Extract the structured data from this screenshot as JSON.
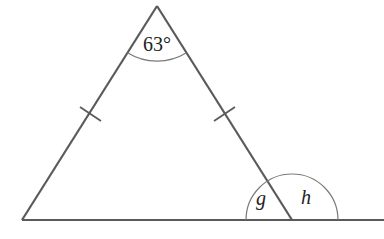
{
  "diagram": {
    "type": "isosceles-triangle",
    "apex_angle_label": "63°",
    "interior_angle_label": "g",
    "exterior_angle_label": "h",
    "equal_sides_marked": true,
    "colors": {
      "line": "#5a5a5a",
      "arc": "#7a7a7a",
      "text": "#222222"
    }
  }
}
